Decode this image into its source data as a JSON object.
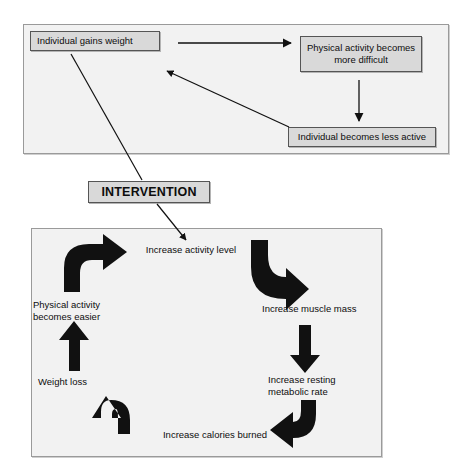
{
  "figure": {
    "type": "flow-diagram",
    "title_visible": false,
    "background_color": "#ffffff",
    "panel_fill": "#f2f2f2",
    "panel_border": "#9a9a9a",
    "box_fill": "#d9d9d9",
    "box_border": "#555555",
    "arrow_color": "#111111"
  },
  "top_cycle": {
    "name": "vicious-cycle",
    "boxes": [
      {
        "id": "gains-weight",
        "label": "Individual gains weight"
      },
      {
        "id": "harder",
        "label": "Physical activity\nbecomes more difficult"
      },
      {
        "id": "less-active",
        "label": "Individual becomes less active"
      }
    ],
    "connections": [
      {
        "from": "gains-weight",
        "to": "harder",
        "style": "straight-arrow"
      },
      {
        "from": "harder",
        "to": "less-active",
        "style": "straight-arrow"
      },
      {
        "from": "less-active",
        "to": "gains-weight",
        "style": "straight-arrow"
      }
    ]
  },
  "intervention": {
    "label": "INTERVENTION",
    "incoming_from": "gains-weight",
    "outgoing_to": "increase-activity-level"
  },
  "bottom_cycle": {
    "name": "virtuous-cycle",
    "direction": "clockwise",
    "labels": [
      {
        "id": "increase-activity-level",
        "label": "Increase activity level"
      },
      {
        "id": "increase-muscle-mass",
        "label": "Increase muscle mass"
      },
      {
        "id": "increase-resting-mr",
        "label": "Increase resting\nmetabolic rate"
      },
      {
        "id": "increase-calories",
        "label": "Increase calories burned"
      },
      {
        "id": "weight-loss",
        "label": "Weight loss"
      },
      {
        "id": "physical-activity-easier",
        "label": "Physical activity\nbecomes easier"
      }
    ],
    "arrows": [
      {
        "id": "arrow-top-right",
        "shape": "elbow-curve",
        "direction": "down"
      },
      {
        "id": "arrow-right",
        "shape": "straight",
        "direction": "down"
      },
      {
        "id": "arrow-bottom-right",
        "shape": "elbow-curve",
        "direction": "left"
      },
      {
        "id": "arrow-bottom-left",
        "shape": "elbow-curve",
        "direction": "up"
      },
      {
        "id": "arrow-left",
        "shape": "straight",
        "direction": "up"
      },
      {
        "id": "arrow-top-left",
        "shape": "elbow-curve",
        "direction": "right"
      }
    ]
  }
}
